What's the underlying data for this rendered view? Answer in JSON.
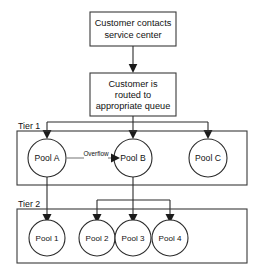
{
  "diagram": {
    "type": "flowchart",
    "process_boxes": [
      {
        "id": "contact",
        "lines": [
          "Customer contacts",
          "service center"
        ]
      },
      {
        "id": "routed",
        "lines": [
          "Customer is",
          "routed to",
          "appropriate queue"
        ]
      }
    ],
    "tiers": [
      {
        "id": "tier1",
        "label": "Tier 1",
        "pools": [
          {
            "id": "pool-a",
            "label": "Pool A"
          },
          {
            "id": "pool-b",
            "label": "Pool B"
          },
          {
            "id": "pool-c",
            "label": "Pool C"
          }
        ]
      },
      {
        "id": "tier2",
        "label": "Tier 2",
        "pools": [
          {
            "id": "pool-1",
            "label": "Pool 1"
          },
          {
            "id": "pool-2",
            "label": "Pool 2"
          },
          {
            "id": "pool-3",
            "label": "Pool 3"
          },
          {
            "id": "pool-4",
            "label": "Pool 4"
          }
        ]
      }
    ],
    "edge_labels": [
      {
        "id": "overflow",
        "label": "Overflow",
        "from": "pool-a",
        "to": "pool-b"
      }
    ],
    "colors": {
      "background": "#ffffff",
      "stroke": "#2b2b2b",
      "box_stroke": "#3a3a3a",
      "overflow_stroke": "#8a8a8a",
      "text": "#121212"
    }
  }
}
